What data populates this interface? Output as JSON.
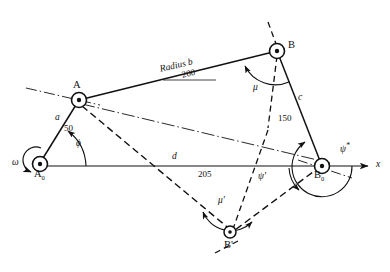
{
  "figure": {
    "type": "four-bar-linkage-kinematic-diagram"
  },
  "joints": [
    {
      "id": "A0",
      "label": "A",
      "sub": "0",
      "x": 40,
      "y": 163,
      "kind": "fixed-pivot"
    },
    {
      "id": "A",
      "label": "A",
      "sub": "",
      "x": 78,
      "y": 100,
      "kind": "moving-pivot"
    },
    {
      "id": "B",
      "label": "B",
      "sub": "",
      "x": 277,
      "y": 50,
      "kind": "moving-pivot"
    },
    {
      "id": "B0",
      "label": "B",
      "sub": "0",
      "x": 322,
      "y": 166,
      "kind": "fixed-pivot"
    },
    {
      "id": "Bp",
      "label": "B'",
      "sub": "",
      "x": 229,
      "y": 233,
      "kind": "moving-pivot"
    }
  ],
  "links": [
    {
      "name": "a",
      "label": "a",
      "value": "50",
      "from": "A0",
      "to": "A"
    },
    {
      "name": "b",
      "label": "Radius b",
      "value": "200",
      "from": "A",
      "to": "B"
    },
    {
      "name": "c",
      "label": "c",
      "value": "150",
      "from": "B",
      "to": "B0"
    },
    {
      "name": "d",
      "label": "d",
      "value": "205",
      "from": "A0",
      "to": "B0"
    }
  ],
  "angles": [
    {
      "name": "phi",
      "label": "ϕ",
      "at": "A0"
    },
    {
      "name": "mu",
      "label": "μ",
      "at": "B"
    },
    {
      "name": "psi-star",
      "label": "ψ",
      "sup": "*",
      "at": "B0"
    },
    {
      "name": "psi-prime",
      "label": "ψ'",
      "at": "B0"
    },
    {
      "name": "mu-prime",
      "label": "μ'",
      "at": "Bp"
    }
  ],
  "axis": {
    "label": "x",
    "x_arrow_tip": {
      "x": 372,
      "y": 166
    }
  },
  "drive": {
    "label": "ω",
    "at": "A0"
  },
  "colors": {
    "stroke": "#111111",
    "background": "#ffffff"
  }
}
